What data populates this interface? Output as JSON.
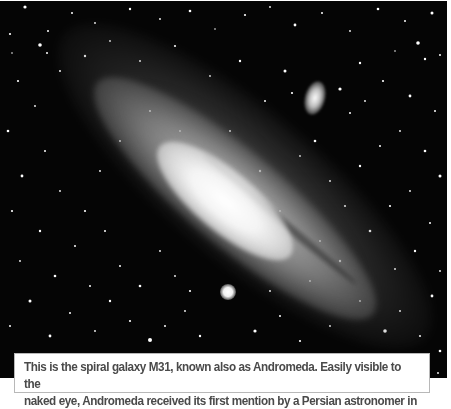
{
  "image": {
    "subject": "Andromeda Galaxy (M31) with companion galaxies",
    "palette": {
      "sky": "#050505",
      "core": "#ffffff",
      "disk": "#aaaaaa",
      "caption_text": "#4a4a4a",
      "caption_border": "#b8b8b8",
      "caption_bg": "#ffffff"
    }
  },
  "caption": {
    "line1": "This is the spiral galaxy M31, known also as Andromeda. Easily visible to the",
    "line2": "naked eye, Andromeda received its first mention by a Persian astronomer in"
  }
}
